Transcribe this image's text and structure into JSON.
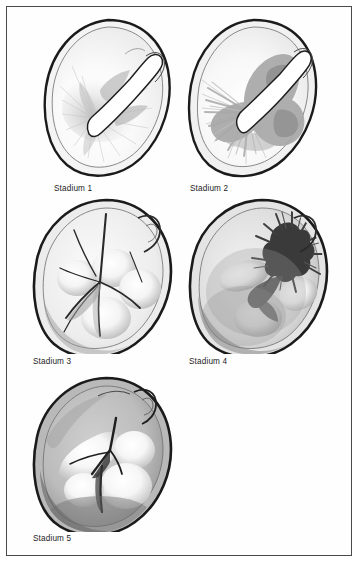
{
  "plate": {
    "background_color": "#ffffff",
    "frame_color": "#4a4a4a",
    "ink_color": "#1d1d1d"
  },
  "figures": [
    {
      "id": "stadium-1",
      "caption": "Stadium 1",
      "description": "Cross-section of cervix, stage 1: narrow central slit with faint radiating gray striations around the canal",
      "fill_outer": "#f4f4f4",
      "fill_inner": "#fbfbfb",
      "shading": "#c9c9c9",
      "severity": 1
    },
    {
      "id": "stadium-2",
      "caption": "Stadium 2",
      "description": "Cross-section of cervix, stage 2: broad mid-gray infiltration spreading from the canal with feathered radiating edges",
      "fill_outer": "#f1f1f1",
      "fill_inner": "#f8f8f8",
      "shading": "#a8a8a8",
      "severity": 2
    },
    {
      "id": "stadium-3",
      "caption": "Stadium 3",
      "description": "Cross-section of cervix, stage 3: four rounded pale lobes separated by dark branching septa",
      "fill_outer": "#ececec",
      "fill_inner": "#f6f6f6",
      "shading": "#8f8f8f",
      "severity": 3
    },
    {
      "id": "stadium-4",
      "caption": "Stadium 4",
      "description": "Cross-section of cervix, stage 4: dark ragged necrotic burst at upper right with pale lobes below",
      "fill_outer": "#e4e4e4",
      "fill_inner": "#f0f0f0",
      "shading": "#4c4c4c",
      "severity": 4
    },
    {
      "id": "stadium-5",
      "caption": "Stadium 5",
      "description": "Cross-section of cervix, stage 5: uniformly dark gray stroma with large pale coalescent lobes at centre",
      "fill_outer": "#b9b9b9",
      "fill_inner": "#cfcfcf",
      "shading": "#6b6b6b",
      "severity": 5
    }
  ]
}
